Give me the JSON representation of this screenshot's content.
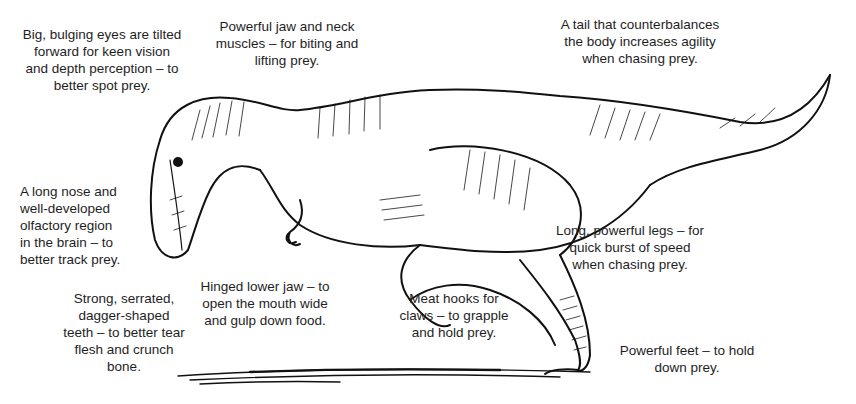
{
  "diagram": {
    "labels": [
      {
        "id": "eyes",
        "lines": [
          "Big, bulging eyes are tilted",
          "forward for keen vision",
          "and depth perception – to",
          "better spot prey."
        ]
      },
      {
        "id": "jaw-neck",
        "lines": [
          "Powerful jaw and neck",
          "muscles – for biting and",
          "lifting prey."
        ]
      },
      {
        "id": "tail",
        "lines": [
          "A tail that counterbalances",
          "the body increases agility",
          "when chasing prey."
        ]
      },
      {
        "id": "nose",
        "lines": [
          "A long nose and",
          "well-developed",
          "olfactory region",
          "in the brain – to",
          "better track prey."
        ]
      },
      {
        "id": "legs",
        "lines": [
          "Long, powerful legs – for",
          "quick burst of speed",
          "when chasing prey."
        ]
      },
      {
        "id": "lower-jaw",
        "lines": [
          "Hinged lower jaw – to",
          "open the mouth wide",
          "and gulp down food."
        ]
      },
      {
        "id": "claws",
        "lines": [
          "Meat hooks for",
          "claws – to grapple",
          "and hold prey."
        ]
      },
      {
        "id": "teeth",
        "lines": [
          "Strong, serrated,",
          "dagger-shaped",
          "teeth – to better tear",
          "flesh and crunch",
          "bone."
        ]
      },
      {
        "id": "feet",
        "lines": [
          "Powerful feet – to hold",
          "down prey."
        ]
      }
    ]
  }
}
